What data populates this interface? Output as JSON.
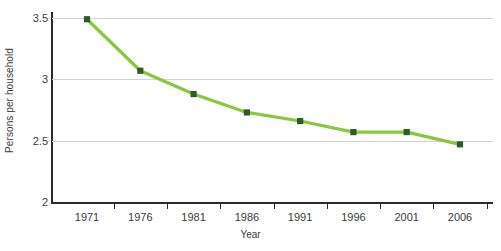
{
  "chart_data": {
    "type": "line",
    "title": "",
    "xlabel": "Year",
    "ylabel": "Persons per household",
    "categories": [
      "1971",
      "1976",
      "1981",
      "1986",
      "1991",
      "1996",
      "2001",
      "2006"
    ],
    "x": [
      1971,
      1976,
      1981,
      1986,
      1991,
      1996,
      2001,
      2006
    ],
    "values": [
      3.49,
      3.07,
      2.88,
      2.73,
      2.66,
      2.57,
      2.57,
      2.47
    ],
    "series": [
      {
        "name": "Persons per household",
        "values": [
          3.49,
          3.07,
          2.88,
          2.73,
          2.66,
          2.57,
          2.57,
          2.47
        ]
      }
    ],
    "ylim": [
      2,
      3.5
    ],
    "yticks": [
      "2",
      "2.5",
      "3",
      "3.5"
    ],
    "ytick_values": [
      2,
      2.5,
      3,
      3.5
    ],
    "xlim": [
      1971,
      2006
    ],
    "grid": "horizontal",
    "legend": "none",
    "line_color": "#8CC63E",
    "marker_color": "#2F5B2A",
    "marker_shape": "square",
    "gridline_color": "#D2D2D2",
    "axis_color": "#2B2B2B",
    "background_color": "#FFFFFF",
    "text_color": "#3B3B3B"
  }
}
